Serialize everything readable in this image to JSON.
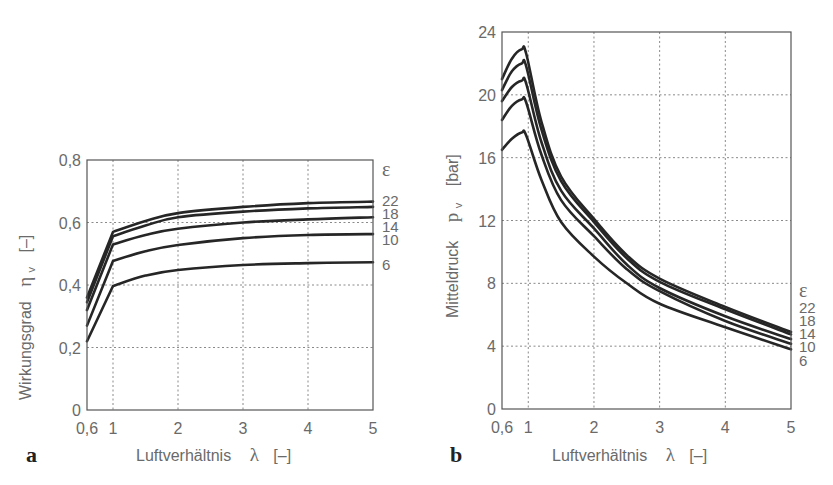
{
  "chart_data": [
    {
      "id": "a",
      "type": "line",
      "panel_label": "a",
      "title": "",
      "xlabel": "Luftverhältnis",
      "xlabel_symbol": "λ",
      "xlabel_unit": "[–]",
      "ylabel": "Wirkungsgrad",
      "ylabel_symbol": "η",
      "ylabel_sub": "v",
      "ylabel_unit": "[–]",
      "xlim": [
        0.6,
        5
      ],
      "ylim": [
        0,
        0.8
      ],
      "xticks": [
        0.6,
        1,
        2,
        3,
        4,
        5
      ],
      "xtick_labels": [
        "0,6",
        "1",
        "2",
        "3",
        "4",
        "5"
      ],
      "yticks": [
        0,
        0.2,
        0.4,
        0.6,
        0.8
      ],
      "ytick_labels": [
        "0",
        "0,2",
        "0,4",
        "0,6",
        "0,8"
      ],
      "grid": true,
      "legend_title": "ε",
      "legend_position": "right, at curve ends",
      "series": [
        {
          "name": "22",
          "x": [
            0.6,
            1.0,
            1.5,
            2,
            3,
            4,
            5
          ],
          "y": [
            0.36,
            0.57,
            0.605,
            0.63,
            0.65,
            0.662,
            0.667
          ]
        },
        {
          "name": "18",
          "x": [
            0.6,
            1.0,
            1.5,
            2,
            3,
            4,
            5
          ],
          "y": [
            0.345,
            0.556,
            0.59,
            0.617,
            0.635,
            0.645,
            0.65
          ]
        },
        {
          "name": "14",
          "x": [
            0.6,
            1.0,
            1.5,
            2,
            3,
            4,
            5
          ],
          "y": [
            0.32,
            0.53,
            0.56,
            0.58,
            0.6,
            0.61,
            0.617
          ]
        },
        {
          "name": "10",
          "x": [
            0.6,
            1.0,
            1.5,
            2,
            3,
            4,
            5
          ],
          "y": [
            0.27,
            0.477,
            0.508,
            0.528,
            0.55,
            0.56,
            0.563
          ]
        },
        {
          "name": "6",
          "x": [
            0.6,
            1.0,
            1.5,
            2,
            3,
            4,
            5
          ],
          "y": [
            0.22,
            0.397,
            0.43,
            0.448,
            0.464,
            0.47,
            0.473
          ]
        }
      ]
    },
    {
      "id": "b",
      "type": "line",
      "panel_label": "b",
      "title": "",
      "xlabel": "Luftverhältnis",
      "xlabel_symbol": "λ",
      "xlabel_unit": "[–]",
      "ylabel": "Mitteldruck",
      "ylabel_symbol": "p",
      "ylabel_sub": "v",
      "ylabel_unit": "[bar]",
      "xlim": [
        0.6,
        5
      ],
      "ylim": [
        0,
        24
      ],
      "xticks": [
        0.6,
        1,
        2,
        3,
        4,
        5
      ],
      "xtick_labels": [
        "0,6",
        "1",
        "2",
        "3",
        "4",
        "5"
      ],
      "yticks": [
        0,
        4,
        8,
        12,
        16,
        20,
        24
      ],
      "ytick_labels": [
        "0",
        "4",
        "8",
        "12",
        "16",
        "20",
        "24"
      ],
      "grid": true,
      "legend_title": "ε",
      "legend_position": "right, below curve ends",
      "series": [
        {
          "name": "22",
          "x": [
            0.6,
            0.75,
            0.9,
            0.97,
            1.2,
            1.5,
            2,
            2.5,
            3,
            4,
            5
          ],
          "y": [
            21.0,
            22.3,
            22.9,
            22.6,
            18.3,
            14.8,
            12.1,
            9.8,
            8.3,
            6.5,
            4.9
          ]
        },
        {
          "name": "18",
          "x": [
            0.6,
            0.75,
            0.9,
            0.97,
            1.2,
            1.5,
            2,
            2.5,
            3,
            4,
            5
          ],
          "y": [
            20.3,
            21.5,
            22.0,
            21.8,
            17.8,
            14.5,
            11.9,
            9.6,
            8.1,
            6.35,
            4.75
          ]
        },
        {
          "name": "14",
          "x": [
            0.6,
            0.75,
            0.9,
            0.97,
            1.2,
            1.5,
            2,
            2.5,
            3,
            4,
            5
          ],
          "y": [
            19.6,
            20.5,
            20.9,
            20.7,
            17.0,
            13.9,
            11.5,
            9.2,
            7.7,
            5.9,
            4.45
          ]
        },
        {
          "name": "10",
          "x": [
            0.6,
            0.75,
            0.9,
            0.97,
            1.2,
            1.5,
            2,
            2.5,
            3,
            4,
            5
          ],
          "y": [
            18.4,
            19.3,
            19.7,
            19.5,
            16.2,
            13.3,
            11.0,
            8.9,
            7.5,
            5.6,
            4.15
          ]
        },
        {
          "name": "6",
          "x": [
            0.6,
            0.75,
            0.9,
            0.97,
            1.2,
            1.5,
            2,
            2.5,
            3,
            4,
            5
          ],
          "y": [
            16.5,
            17.2,
            17.6,
            17.4,
            14.6,
            11.9,
            9.7,
            8.0,
            6.7,
            5.2,
            3.8
          ]
        }
      ]
    }
  ]
}
